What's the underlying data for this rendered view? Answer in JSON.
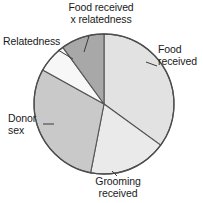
{
  "figure": {
    "name": "pie-chart-figure",
    "background_color": "#ffffff",
    "outline_color": "#4d4d4d",
    "text_color": "#1a1a1a"
  },
  "labels": {
    "food_x_relatedness_line1": "Food received",
    "food_x_relatedness_line2": "x relatedness",
    "relatedness": "Relatedness",
    "food_received_line1": "Food",
    "food_received_line2": "received",
    "donor_sex_line1": "Donor",
    "donor_sex_line2": "sex",
    "grooming_received_line1": "Grooming",
    "grooming_received_line2": "received"
  },
  "chart_data": {
    "type": "pie",
    "title": "",
    "subtitle": "",
    "xlabel": "",
    "ylabel": "",
    "legend_position": "none",
    "grid": false,
    "labels_placement": "outside-with-leader-lines",
    "start_angle_deg": 0,
    "direction": "clockwise",
    "center_px": [
      104,
      104
    ],
    "radius_px": 70,
    "categories": [
      "Food received",
      "Grooming received",
      "Donor sex",
      "Relatedness",
      "Food received x relatedness"
    ],
    "values": [
      35,
      18,
      30,
      7,
      10
    ],
    "units": "percent of variance explained",
    "slices": [
      {
        "label": "Food received",
        "value": 35,
        "start_angle_deg": 0,
        "end_angle_deg": 126,
        "color": "#e2e2e2"
      },
      {
        "label": "Grooming received",
        "value": 18,
        "start_angle_deg": 126,
        "end_angle_deg": 191,
        "color": "#eaeaea"
      },
      {
        "label": "Donor sex",
        "value": 30,
        "start_angle_deg": 191,
        "end_angle_deg": 299,
        "color": "#c9c9c9"
      },
      {
        "label": "Relatedness",
        "value": 7,
        "start_angle_deg": 299,
        "end_angle_deg": 324,
        "color": "#f7f7f7"
      },
      {
        "label": "Food received x relatedness",
        "value": 10,
        "start_angle_deg": 324,
        "end_angle_deg": 360,
        "color": "#a8a8a8"
      }
    ]
  }
}
